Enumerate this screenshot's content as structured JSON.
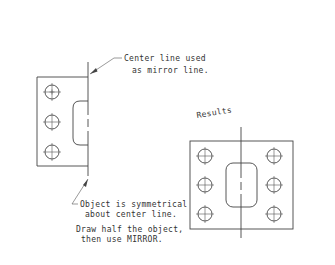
{
  "diagram": {
    "colors": {
      "line": "#444444",
      "text": "#333333",
      "background": "#ffffff"
    },
    "annotations": {
      "center_line": [
        "Center line used",
        "as mirror line."
      ],
      "symmetry": [
        "Object is symmetrical",
        "about center line."
      ],
      "instruction": [
        "Draw half the object,",
        "then use MIRROR."
      ],
      "results": "Results"
    },
    "left_object": {
      "description": "half object before mirror",
      "hole_count": 3
    },
    "right_object": {
      "description": "mirrored result",
      "hole_count": 6
    }
  }
}
